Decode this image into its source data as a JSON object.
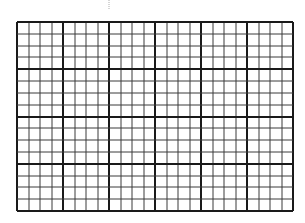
{
  "grid": {
    "major_columns": 6,
    "major_rows": 4,
    "minor_per_major_x": 4,
    "minor_per_major_y": 4,
    "colors": {
      "background": "#ffffff",
      "major_line": "#1a1a1a",
      "minor_line": "#3a3a3a"
    }
  }
}
